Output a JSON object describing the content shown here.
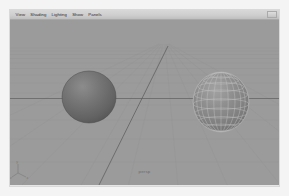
{
  "window": {
    "title": "Maya 3D Viewport Panel",
    "background_color": "#f4f4f4",
    "frame_border_color": "#d9d9d9"
  },
  "menubar": {
    "items": [
      {
        "label": "View",
        "name": "menu-view"
      },
      {
        "label": "Shading",
        "name": "menu-shading"
      },
      {
        "label": "Lighting",
        "name": "menu-lighting"
      },
      {
        "label": "Show",
        "name": "menu-show"
      },
      {
        "label": "Panels",
        "name": "menu-panels"
      }
    ],
    "background_color": "#cfcfcf",
    "text_color": "#2c2c2c"
  },
  "viewport": {
    "background_color": "#9b9b9b",
    "grid": {
      "visible": true,
      "line_color": "#8f8f8f",
      "axis_color": "#6a6a6a",
      "horizon_y": 38,
      "perspective": true
    },
    "label": "persp",
    "axis_gizmo": {
      "name": "axis-gizmo",
      "labels": [
        "y",
        "x",
        "z"
      ]
    },
    "objects": [
      {
        "name": "sphere-smooth-shaded",
        "type": "sphere",
        "shading": "smooth-shaded",
        "wireframe": false,
        "center_x": 79,
        "center_y": 87,
        "radius_x": 27,
        "radius_y": 26,
        "fill_color": "#6f6f6f",
        "highlight_color": "#8a8a8a",
        "shadow_color": "#4e4e4e"
      },
      {
        "name": "sphere-wireframe-on-shaded",
        "type": "sphere",
        "shading": "wireframe-on-shaded",
        "wireframe": true,
        "center_x": 211,
        "center_y": 92,
        "radius_x": 28,
        "radius_y": 30,
        "fill_color": "#8b8b8b",
        "wire_color": "#c9c9c9",
        "latitude_segments": 8,
        "longitude_segments": 12
      }
    ]
  }
}
